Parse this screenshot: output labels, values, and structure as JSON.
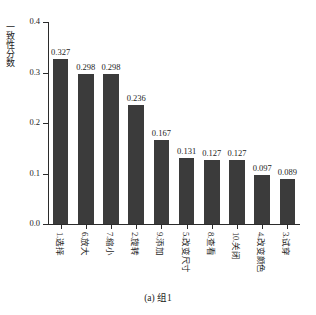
{
  "figure": {
    "caption": "(a) 组1",
    "top_artifact_left": "",
    "top_artifact_right": ""
  },
  "chart_data": {
    "type": "bar",
    "title": "",
    "xlabel": "",
    "ylabel": "一致性分数",
    "ylim": [
      0.0,
      0.4
    ],
    "yticks": [
      "0.0",
      "0.1",
      "0.2",
      "0.3",
      "0.4"
    ],
    "ytick_values": [
      0.0,
      0.1,
      0.2,
      0.3,
      0.4
    ],
    "grid": false,
    "legend": false,
    "bar_color": "#3b3b3b",
    "categories": [
      "1.选择",
      "6.放大",
      "7.缩小",
      "2.旋转",
      "9.添加",
      "5.改变尺寸",
      "8.查看",
      "10.关闭",
      "4.改变颜色",
      "3.试穿"
    ],
    "values": [
      0.327,
      0.298,
      0.298,
      0.236,
      0.167,
      0.131,
      0.127,
      0.127,
      0.097,
      0.089
    ],
    "value_labels": [
      "0.327",
      "0.298",
      "0.298",
      "0.236",
      "0.167",
      "0.131",
      "0.127",
      "0.127",
      "0.097",
      "0.089"
    ]
  }
}
